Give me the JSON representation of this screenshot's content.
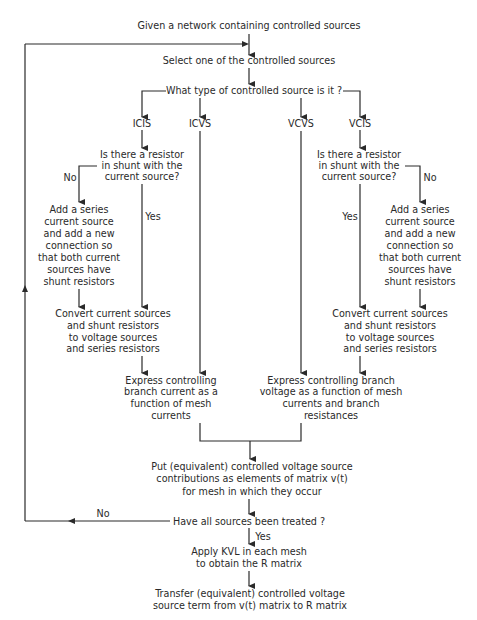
{
  "diagram": {
    "type": "flowchart",
    "nodes": {
      "start": {
        "lines": [
          "Given a network containing controlled sources"
        ]
      },
      "select": {
        "lines": [
          "Select one of the controlled sources"
        ]
      },
      "type_q": {
        "lines": [
          "What type of controlled source is it ?"
        ]
      },
      "icis": {
        "lines": [
          "ICIS"
        ]
      },
      "icvs": {
        "lines": [
          "ICVS"
        ]
      },
      "vcvs": {
        "lines": [
          "VCVS"
        ]
      },
      "vcis": {
        "lines": [
          "VCIS"
        ]
      },
      "shunt_q_left": {
        "lines": [
          "Is there a resistor",
          "in shunt with the",
          "current source?"
        ]
      },
      "shunt_q_right": {
        "lines": [
          "Is there a resistor",
          "in shunt with the",
          "current source?"
        ]
      },
      "add_series_left": {
        "lines": [
          "Add a series",
          "current source",
          "and add a new",
          "connection so",
          "that both current",
          "sources have",
          "shunt resistors"
        ]
      },
      "add_series_right": {
        "lines": [
          "Add a series",
          "current source",
          "and add a new",
          "connection so",
          "that both current",
          "sources have",
          "shunt resistors"
        ]
      },
      "convert_left": {
        "lines": [
          "Convert current sources",
          "and shunt resistors",
          "to voltage sources",
          "and series resistors"
        ]
      },
      "convert_right": {
        "lines": [
          "Convert current sources",
          "and shunt resistors",
          "to voltage sources",
          "and series resistors"
        ]
      },
      "express_current": {
        "lines": [
          "Express controlling",
          "branch current as a",
          "function of mesh",
          "currents"
        ]
      },
      "express_voltage": {
        "lines": [
          "Express controlling branch",
          "voltage as a function of mesh",
          "currents and branch",
          "resistances"
        ]
      },
      "put_equiv": {
        "lines": [
          "Put (equivalent) controlled voltage source",
          "contributions as elements of matrix v(t)",
          "for mesh in which they occur"
        ]
      },
      "all_treated_q": {
        "lines": [
          "Have all sources been treated ?"
        ]
      },
      "apply_kvl": {
        "lines": [
          "Apply KVL in each mesh",
          "to obtain the R matrix"
        ]
      },
      "transfer": {
        "lines": [
          "Transfer (equivalent) controlled voltage",
          "source term from v(t) matrix to R matrix"
        ]
      }
    },
    "edge_labels": {
      "no_left": "No",
      "yes_left": "Yes",
      "no_right": "No",
      "yes_right": "Yes",
      "no_loop": "No",
      "yes_down": "Yes"
    },
    "colors": {
      "line": "#2a2a2a",
      "background": "#ffffff"
    }
  }
}
